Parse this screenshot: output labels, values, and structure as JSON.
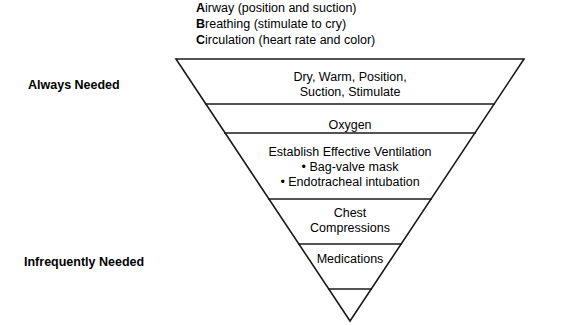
{
  "abc_list": [
    {
      "cue": "A",
      "rest": "irway (position and suction)"
    },
    {
      "cue": "B",
      "rest": "reathing (stimulate to cry)"
    },
    {
      "cue": "C",
      "rest": "irculation (heart rate and color)"
    }
  ],
  "labels": {
    "always_needed": "Always Needed",
    "infrequently_needed": "Infrequently Needed"
  },
  "pyramid": {
    "rows": [
      {
        "line1": "Dry, Warm, Position,",
        "line2": "Suction, Stimulate"
      },
      {
        "line1": "Oxygen",
        "line2": ""
      },
      {
        "line1": "Establish Effective Ventilation",
        "bullet1": "• Bag-valve mask",
        "bullet2": "• Endotracheal intubation"
      },
      {
        "line1": "Chest",
        "line2": "Compressions"
      },
      {
        "line1": "Medications",
        "line2": ""
      }
    ]
  },
  "colors": {
    "stroke": "#1a1a1a",
    "text": "#000000",
    "background": "#ffffff"
  }
}
